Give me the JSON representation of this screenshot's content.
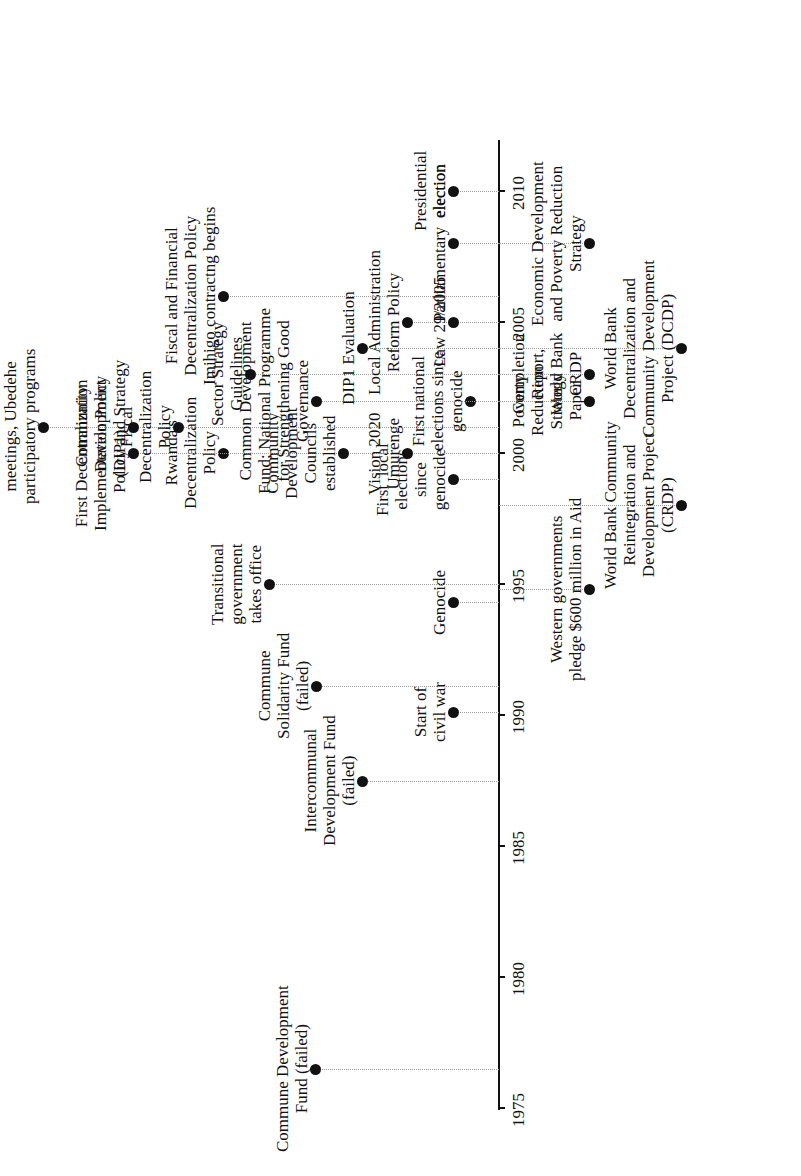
{
  "timeline": {
    "axis": {
      "start_year": 1975,
      "end_year": 2011,
      "ticks": [
        "1975",
        "1980",
        "1985",
        "1990",
        "1995",
        "2000",
        "2005",
        "2010"
      ]
    },
    "events_above": [
      {
        "year": 1976.5,
        "text": "Commune Development\nFund (failed)",
        "depth": 315
      },
      {
        "year": 1987.5,
        "text": "Intercommunal\nDevelopment Fund\n(failed)",
        "depth": 362
      },
      {
        "year": 1990.1,
        "text": "Start of\ncivil war",
        "depth": 453
      },
      {
        "year": 1991.1,
        "text": "Commune\nSolidarity Fund\n(failed)",
        "depth": 316
      },
      {
        "year": 1994.3,
        "text": "Genocide",
        "depth": 453
      },
      {
        "year": 1995.0,
        "text": "Transitional\ngovernment\ntakes office",
        "depth": 269
      },
      {
        "year": 1999.0,
        "text": "First  local\nelections\nsince\ngenocide",
        "depth": 453
      },
      {
        "year": 2000.0,
        "text": "Rwanda's\nDecentralization\nPolicy",
        "depth": 223
      },
      {
        "year": 2000.0,
        "text": "First Decentralization\nImplementation Policy\n(DIP1)",
        "depth": 133
      },
      {
        "year": 2000.0,
        "text": "Community\nDevelopment\nCouncils\nestablished",
        "depth": 343
      },
      {
        "year": 2000.0,
        "text": "Vision 2020\nUmurenge",
        "depth": 407
      },
      {
        "year": 2001.0,
        "text": "meetings, Ubedehe\nparticipatory programs",
        "depth": 43
      },
      {
        "year": 2001.0,
        "text": "Community\nDevelopment\nPolicy and Strategy",
        "depth": 133
      },
      {
        "year": 2001.0,
        "text": "Fiscal\nDecentralization\nPolicy",
        "depth": 178
      },
      {
        "year": 2002.0,
        "text": "First national\nelections since\ngenocide",
        "depth": 470
      },
      {
        "year": 2002.0,
        "text": "Common Development\nFund; National Programme\nfor Strengthening Good\nGovernance",
        "depth": 316
      },
      {
        "year": 2003.0,
        "text": "Sector Strategy\nGuidelines",
        "depth": 250
      },
      {
        "year": 2004.0,
        "text": "DIP1 Evaluation",
        "depth": 362
      },
      {
        "year": 2005.0,
        "text": "Local Administration\nReform Policy",
        "depth": 407
      },
      {
        "year": 2005.0,
        "text": "Law 29/2005",
        "depth": 453
      },
      {
        "year": 2006.0,
        "text": "Fiscal and Financial\nDecentralization Policy\nImihigo contractng begins",
        "depth": 223
      },
      {
        "year": 2008.0,
        "text": "Parliamentary  election",
        "depth": 453
      },
      {
        "year": 2010.0,
        "text": "Presidential\nelection",
        "depth": 453
      }
    ],
    "events_below": [
      {
        "year": 1994.8,
        "text": "Western governments\npledge $600 million in Aid",
        "depth": 589
      },
      {
        "year": 1998.0,
        "text": "World Bank Community\nReintegration and\nDevelopment Project\n(CRDP)",
        "depth": 681
      },
      {
        "year": 2002.0,
        "text": "Poverty\nReduction\nStrategy\nPaper",
        "depth": 589
      },
      {
        "year": 2003.0,
        "text": "Completion\nReport,\nWorld Bank\nCRDP",
        "depth": 589
      },
      {
        "year": 2004.0,
        "text": "World Bank\nDecentralization and\nCommunity Development\nProject (DCDP)",
        "depth": 681
      },
      {
        "year": 2008.0,
        "text": "Economic Development\nand Poverty Reduction\nStrategy",
        "depth": 589
      }
    ]
  }
}
